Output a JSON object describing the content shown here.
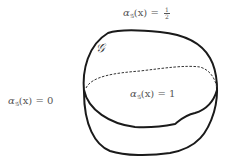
{
  "figure": {
    "set_label": "𝒢",
    "labels": {
      "top": {
        "func": "α",
        "sub": "𝒢",
        "arg": "(x)",
        "eq": " = ",
        "value_num": "1",
        "value_den": "2"
      },
      "left": {
        "func": "α",
        "sub": "𝒢",
        "arg": "(x)",
        "eq": " = ",
        "value": "0"
      },
      "center": {
        "func": "α",
        "sub": "𝒢",
        "arg": "(x)",
        "eq": " = ",
        "value": "1"
      }
    },
    "colors": {
      "stroke": "#1a1a1a",
      "text": "#555555"
    }
  }
}
